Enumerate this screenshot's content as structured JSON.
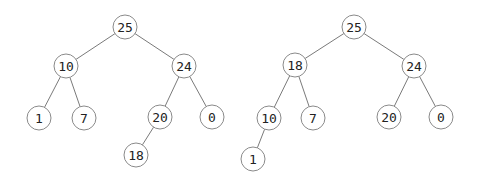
{
  "radius": 12,
  "trees": [
    {
      "name": "heap-before",
      "nodes": [
        {
          "id": "a25",
          "label": "25",
          "x": 125,
          "y": 27
        },
        {
          "id": "a10",
          "label": "10",
          "x": 66,
          "y": 66
        },
        {
          "id": "a24",
          "label": "24",
          "x": 184,
          "y": 66
        },
        {
          "id": "a1",
          "label": "1",
          "x": 39,
          "y": 118
        },
        {
          "id": "a7",
          "label": "7",
          "x": 84,
          "y": 118
        },
        {
          "id": "a20",
          "label": "20",
          "x": 160,
          "y": 117
        },
        {
          "id": "a0",
          "label": "0",
          "x": 212,
          "y": 117
        },
        {
          "id": "a18",
          "label": "18",
          "x": 136,
          "y": 155
        }
      ],
      "edges": [
        [
          "a25",
          "a10"
        ],
        [
          "a25",
          "a24"
        ],
        [
          "a10",
          "a1"
        ],
        [
          "a10",
          "a7"
        ],
        [
          "a24",
          "a20"
        ],
        [
          "a24",
          "a0"
        ],
        [
          "a20",
          "a18"
        ]
      ]
    },
    {
      "name": "heap-after",
      "nodes": [
        {
          "id": "b25",
          "label": "25",
          "x": 354,
          "y": 27
        },
        {
          "id": "b18",
          "label": "18",
          "x": 295,
          "y": 65
        },
        {
          "id": "b24",
          "label": "24",
          "x": 414,
          "y": 66
        },
        {
          "id": "b10",
          "label": "10",
          "x": 269,
          "y": 118
        },
        {
          "id": "b7",
          "label": "7",
          "x": 313,
          "y": 118
        },
        {
          "id": "b20",
          "label": "20",
          "x": 389,
          "y": 117
        },
        {
          "id": "b0",
          "label": "0",
          "x": 441,
          "y": 117
        },
        {
          "id": "b1",
          "label": "1",
          "x": 253,
          "y": 159
        }
      ],
      "edges": [
        [
          "b25",
          "b18"
        ],
        [
          "b25",
          "b24"
        ],
        [
          "b18",
          "b10"
        ],
        [
          "b18",
          "b7"
        ],
        [
          "b24",
          "b20"
        ],
        [
          "b24",
          "b0"
        ],
        [
          "b10",
          "b1"
        ]
      ]
    }
  ]
}
